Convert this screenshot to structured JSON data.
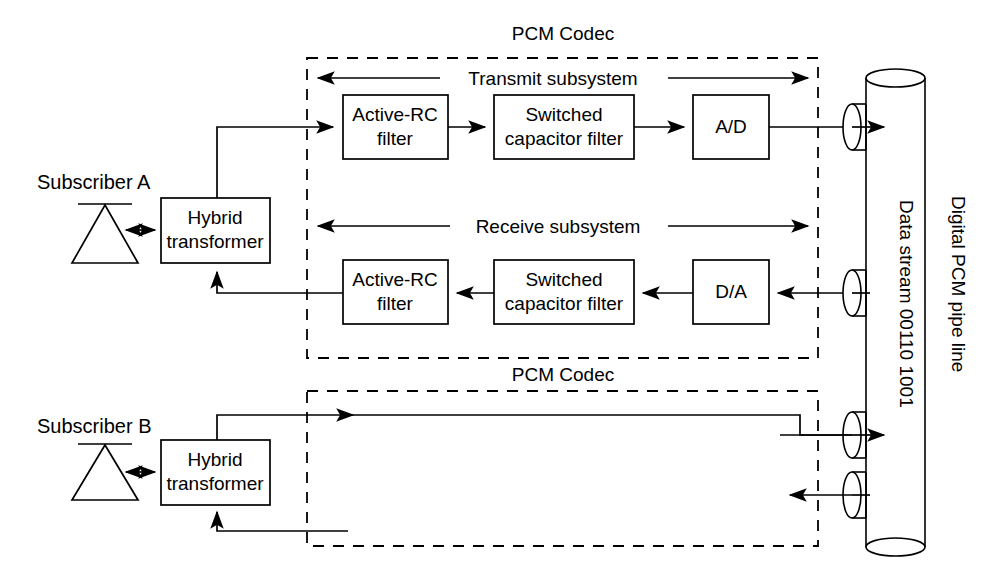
{
  "diagram": {
    "subscribers": [
      {
        "label": "Subscriber A",
        "hybrid": "Hybrid transformer",
        "hybrid_line1": "Hybrid",
        "hybrid_line2": "transformer"
      },
      {
        "label": "Subscriber B",
        "hybrid": "Hybrid transformer",
        "hybrid_line1": "Hybrid",
        "hybrid_line2": "transformer"
      }
    ],
    "codecs": [
      {
        "label": "PCM Codec"
      },
      {
        "label": "PCM Codec"
      }
    ],
    "subsystems": [
      {
        "label": "Transmit subsystem"
      },
      {
        "label": "Receive subsystem"
      }
    ],
    "transmit_blocks": [
      {
        "line1": "Active-RC",
        "line2": "filter"
      },
      {
        "line1": "Switched",
        "line2": "capacitor filter"
      },
      {
        "line1": "A/D",
        "line2": ""
      }
    ],
    "receive_blocks": [
      {
        "line1": "Active-RC",
        "line2": "filter"
      },
      {
        "line1": "Switched",
        "line2": "capacitor filter"
      },
      {
        "line1": "D/A",
        "line2": ""
      }
    ],
    "pipe": {
      "label": "Digital PCM pipe line",
      "stream_label": "Data stream  00110 1001"
    },
    "colors": {
      "stroke": "#000000",
      "background": "#ffffff"
    }
  }
}
